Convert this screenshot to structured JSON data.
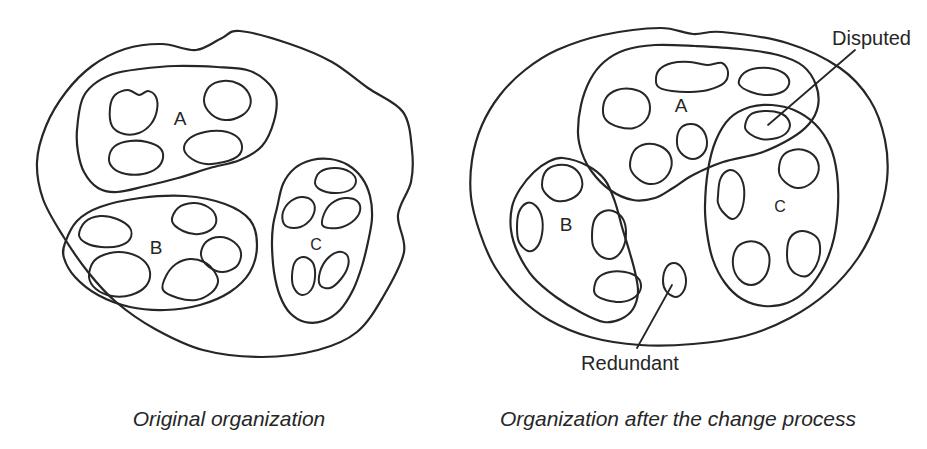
{
  "left_diagram": {
    "caption": "Original organization",
    "group_a_label": "A",
    "group_b_label": "B",
    "group_c_label": "C"
  },
  "right_diagram": {
    "caption": "Organization after the change process",
    "group_a_label": "A",
    "group_b_label": "B",
    "group_c_label": "C",
    "disputed_label": "Disputed",
    "redundant_label": "Redundant"
  },
  "colors": {
    "ink": "#262626",
    "background": "#ffffff"
  }
}
